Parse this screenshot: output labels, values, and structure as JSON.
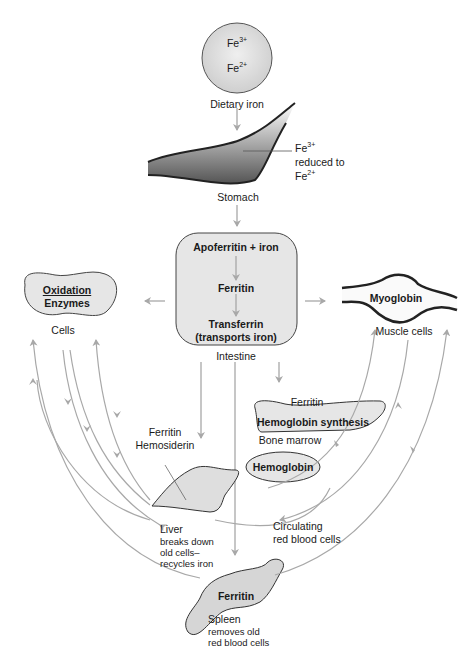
{
  "diagram": {
    "colors": {
      "arrow": "#a8a8a8",
      "fill": "#e2e2e2",
      "outline": "#333333",
      "text": "#1a1a1a"
    },
    "dietary_iron": {
      "ion1": "Fe",
      "ion1_charge": "3+",
      "ion2": "Fe",
      "ion2_charge": "2+",
      "label": "Dietary iron"
    },
    "stomach": {
      "label": "Stomach",
      "note_ion": "Fe",
      "note_charge": "3+",
      "note_line2": "reduced to",
      "note_ion2": "Fe",
      "note_charge2": "2+"
    },
    "intestine": {
      "label": "Intestine",
      "step1": "Apoferritin + iron",
      "step2": "Ferritin",
      "step3": "Transferrin",
      "step3_sub": "(transports iron)"
    },
    "cells": {
      "enzyme_line1": "Oxidation",
      "enzyme_line2": "Enzymes",
      "label": "Cells"
    },
    "muscle": {
      "inner": "Myoglobin",
      "label": "Muscle cells"
    },
    "bone_marrow": {
      "top": "Ferritin",
      "inner": "Hemoglobin synthesis",
      "label": "Bone marrow"
    },
    "liver": {
      "top1": "Ferritin",
      "top2": "Hemosiderin",
      "label": "Liver",
      "desc1": "breaks down",
      "desc2": "old cells–",
      "desc3": "recycles iron"
    },
    "rbc": {
      "inner": "Hemoglobin",
      "label1": "Circulating",
      "label2": "red blood cells"
    },
    "spleen": {
      "inner": "Ferritin",
      "label": "Spleen",
      "desc1": "removes old",
      "desc2": "red blood cells"
    }
  }
}
